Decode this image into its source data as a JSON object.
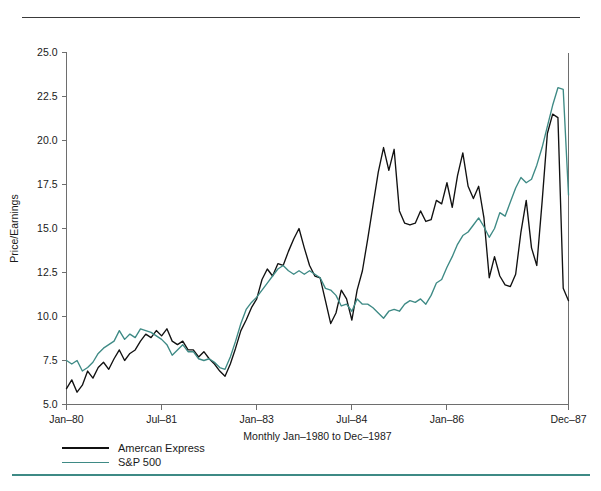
{
  "figure": {
    "y_axis_title": "Price/Earnings",
    "x_axis_title": "Monthly Jan–1980 to Dec–1987"
  },
  "legend": {
    "position": "below-axis-left",
    "items": [
      {
        "label": "Amercan Express",
        "color": "#111111"
      },
      {
        "label": "S&P 500",
        "color": "#3e8a85"
      }
    ]
  },
  "rules": {
    "top_rule_color": "#3a3a3a",
    "bottom_rule_color": "#3e8a85"
  },
  "chart_data": {
    "type": "line",
    "title": "",
    "subtitle": "",
    "xlabel": "Monthly Jan–1980 to Dec–1987",
    "ylabel": "Price/Earnings",
    "grid": false,
    "legend_position": "bottom-left",
    "ylim": [
      5.0,
      25.0
    ],
    "ytick_labels": [
      "5.0",
      "7.5",
      "10.0",
      "12.5",
      "15.0",
      "17.5",
      "20.0",
      "22.5",
      "25.0"
    ],
    "yticks": [
      5.0,
      7.5,
      10.0,
      12.5,
      15.0,
      17.5,
      20.0,
      22.5,
      25.0
    ],
    "xtick_labels": [
      "Jan–80",
      "Jul–81",
      "Jan–83",
      "Jul–84",
      "Jan–86",
      "Dec–87"
    ],
    "xtick_indices": [
      0,
      18,
      36,
      54,
      72,
      95
    ],
    "x_count": 96,
    "x": [
      "Jan-80",
      "Feb-80",
      "Mar-80",
      "Apr-80",
      "May-80",
      "Jun-80",
      "Jul-80",
      "Aug-80",
      "Sep-80",
      "Oct-80",
      "Nov-80",
      "Dec-80",
      "Jan-81",
      "Feb-81",
      "Mar-81",
      "Apr-81",
      "May-81",
      "Jun-81",
      "Jul-81",
      "Aug-81",
      "Sep-81",
      "Oct-81",
      "Nov-81",
      "Dec-81",
      "Jan-82",
      "Feb-82",
      "Mar-82",
      "Apr-82",
      "May-82",
      "Jun-82",
      "Jul-82",
      "Aug-82",
      "Sep-82",
      "Oct-82",
      "Nov-82",
      "Dec-82",
      "Jan-83",
      "Feb-83",
      "Mar-83",
      "Apr-83",
      "May-83",
      "Jun-83",
      "Jul-83",
      "Aug-83",
      "Sep-83",
      "Oct-83",
      "Nov-83",
      "Dec-83",
      "Jan-84",
      "Feb-84",
      "Mar-84",
      "Apr-84",
      "May-84",
      "Jun-84",
      "Jul-84",
      "Aug-84",
      "Sep-84",
      "Oct-84",
      "Nov-84",
      "Dec-84",
      "Jan-85",
      "Feb-85",
      "Mar-85",
      "Apr-85",
      "May-85",
      "Jun-85",
      "Jul-85",
      "Aug-85",
      "Sep-85",
      "Oct-85",
      "Nov-85",
      "Dec-85",
      "Jan-86",
      "Feb-86",
      "Mar-86",
      "Apr-86",
      "May-86",
      "Jun-86",
      "Jul-86",
      "Aug-86",
      "Sep-86",
      "Oct-86",
      "Nov-86",
      "Dec-86",
      "Jan-87",
      "Feb-87",
      "Mar-87",
      "Apr-87",
      "May-87",
      "Jun-87",
      "Jul-87",
      "Aug-87",
      "Sep-87",
      "Oct-87",
      "Nov-87",
      "Dec-87"
    ],
    "series": [
      {
        "name": "Amercan Express",
        "color": "#111111",
        "values": [
          5.9,
          6.4,
          5.7,
          6.1,
          6.9,
          6.5,
          7.1,
          7.4,
          7.0,
          7.6,
          8.1,
          7.5,
          7.9,
          8.1,
          8.6,
          9.0,
          8.8,
          9.2,
          8.9,
          9.3,
          8.6,
          8.4,
          8.6,
          8.1,
          8.1,
          7.7,
          8.0,
          7.6,
          7.3,
          6.9,
          6.6,
          7.3,
          8.2,
          9.2,
          9.8,
          10.5,
          11.0,
          12.1,
          12.7,
          12.3,
          13.0,
          12.9,
          13.7,
          14.4,
          15.0,
          13.9,
          12.9,
          12.3,
          12.2,
          10.9,
          9.6,
          10.2,
          11.5,
          11.0,
          9.8,
          11.5,
          12.6,
          14.4,
          16.3,
          18.2,
          19.6,
          18.3,
          19.5,
          16.0,
          15.3,
          15.2,
          15.3,
          16.0,
          15.4,
          15.5,
          16.6,
          16.4,
          17.6,
          16.2,
          18.0,
          19.3,
          17.4,
          16.7,
          17.4,
          15.6,
          12.2,
          13.4,
          12.3,
          11.8,
          11.7,
          12.4,
          14.8,
          16.6,
          13.9,
          12.9,
          16.5,
          20.4,
          21.5,
          21.3,
          11.6,
          10.9
        ]
      },
      {
        "name": "S&P 500",
        "color": "#3e8a85",
        "values": [
          7.5,
          7.3,
          7.5,
          6.9,
          7.1,
          7.4,
          7.9,
          8.2,
          8.4,
          8.6,
          9.2,
          8.7,
          9.0,
          8.8,
          9.3,
          9.2,
          9.1,
          8.9,
          8.7,
          8.4,
          7.8,
          8.1,
          8.4,
          8.0,
          8.0,
          7.6,
          7.5,
          7.6,
          7.4,
          7.1,
          7.0,
          7.7,
          8.6,
          9.6,
          10.4,
          10.8,
          11.1,
          11.5,
          11.9,
          12.3,
          12.7,
          12.9,
          12.6,
          12.4,
          12.6,
          12.4,
          12.6,
          12.4,
          12.2,
          11.6,
          11.5,
          11.2,
          10.6,
          10.7,
          10.3,
          11.0,
          10.7,
          10.7,
          10.5,
          10.2,
          9.9,
          10.3,
          10.4,
          10.3,
          10.7,
          10.9,
          10.8,
          11.0,
          10.7,
          11.2,
          11.9,
          12.1,
          12.8,
          13.4,
          14.1,
          14.6,
          14.8,
          15.2,
          15.6,
          15.1,
          14.5,
          15.0,
          15.9,
          15.7,
          16.5,
          17.3,
          17.9,
          17.6,
          17.8,
          18.6,
          19.6,
          20.8,
          22.0,
          23.0,
          22.9,
          16.9
        ]
      }
    ]
  }
}
